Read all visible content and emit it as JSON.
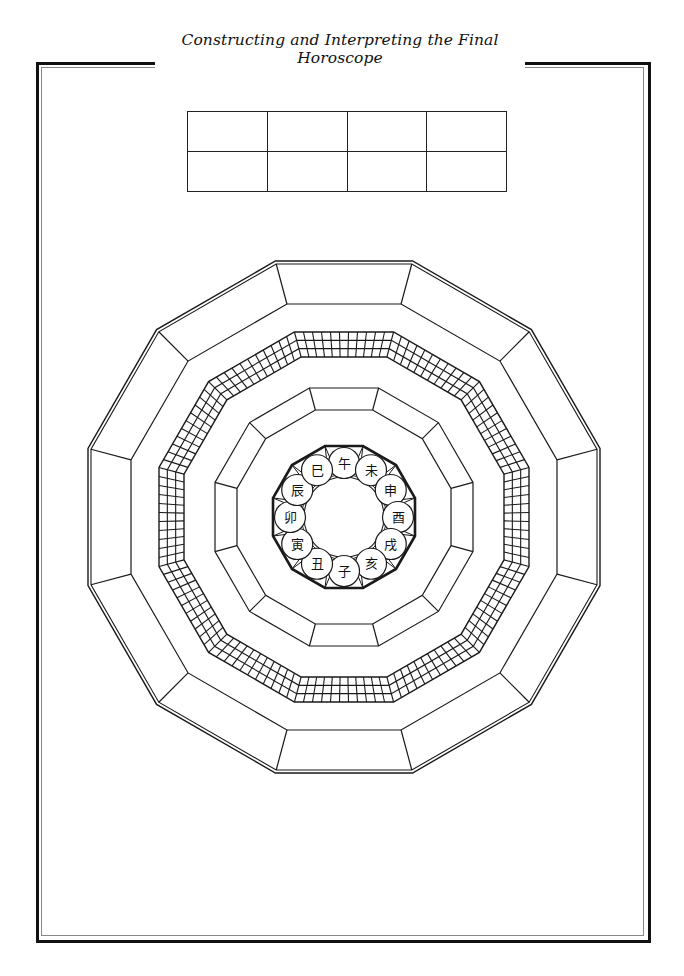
{
  "header": {
    "title": "Constructing and Interpreting the Final Horoscope"
  },
  "top_table": {
    "rows": 2,
    "columns": 4,
    "cells": [
      [
        "",
        "",
        "",
        ""
      ],
      [
        "",
        "",
        "",
        ""
      ]
    ]
  },
  "horoscope_chart": {
    "center": [
      344,
      517
    ],
    "shape": "dodecagon",
    "sides": 12,
    "outer_ring": {
      "outer_apothem": 256,
      "inner_apothem": 213,
      "segments": 12,
      "double_outer_line": true
    },
    "grid_band": {
      "outer_apothem": 185,
      "inner_apothem": 160,
      "rows": 3,
      "cells_per_side": 11
    },
    "middle_ring": {
      "outer_apothem": 129,
      "inner_apothem": 107,
      "segments": 12
    },
    "branch_ring": {
      "outer_apothem": 71,
      "circle_orbit_radius": 54,
      "circle_radius": 15.5,
      "hole_radius": 40,
      "branches": [
        {
          "char": "午",
          "position": "top"
        },
        {
          "char": "未",
          "position": "top-right-1"
        },
        {
          "char": "申",
          "position": "top-right-2"
        },
        {
          "char": "酉",
          "position": "right"
        },
        {
          "char": "戌",
          "position": "bottom-right-2"
        },
        {
          "char": "亥",
          "position": "bottom-right-1"
        },
        {
          "char": "子",
          "position": "bottom"
        },
        {
          "char": "丑",
          "position": "bottom-left-1"
        },
        {
          "char": "寅",
          "position": "bottom-left-2"
        },
        {
          "char": "卯",
          "position": "left"
        },
        {
          "char": "辰",
          "position": "top-left-2"
        },
        {
          "char": "巳",
          "position": "top-left-1"
        }
      ]
    },
    "colors": {
      "line": "#1a1a1a",
      "background": "#ffffff"
    }
  }
}
